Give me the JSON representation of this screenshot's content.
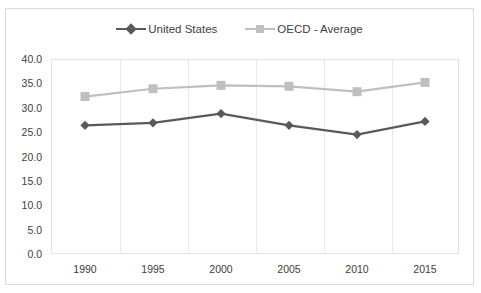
{
  "chart_data": {
    "type": "line",
    "title": "",
    "subtitle": "",
    "xlabel": "",
    "ylabel": "",
    "categories": [
      "1990",
      "1995",
      "2000",
      "2005",
      "2010",
      "2015"
    ],
    "series": [
      {
        "name": "United States",
        "values": [
          26.4,
          26.9,
          28.8,
          26.4,
          24.5,
          27.2
        ],
        "color": "#595959",
        "marker": "diamond"
      },
      {
        "name": "OECD - Average",
        "values": [
          32.3,
          33.9,
          34.6,
          34.4,
          33.3,
          35.2
        ],
        "color": "#bfbfbf",
        "marker": "square"
      }
    ],
    "ylim": [
      0.0,
      40.0
    ],
    "ytick_step": 5.0,
    "ytick_labels": [
      "40.0",
      "35.0",
      "30.0",
      "25.0",
      "20.0",
      "15.0",
      "10.0",
      "5.0",
      "0.0"
    ],
    "ytick_values": [
      40.0,
      35.0,
      30.0,
      25.0,
      20.0,
      15.0,
      10.0,
      5.0,
      0.0
    ],
    "grid": {
      "horizontal": false,
      "vertical": true
    },
    "legend": {
      "position": "top",
      "entries": [
        "United States",
        "OECD - Average"
      ]
    }
  },
  "colors": {
    "series_united_states": "#595959",
    "series_oecd_average": "#bfbfbf",
    "gridline": "#e8e8e8",
    "plot_border": "#e3e3e3",
    "frame_border": "#d9d9d9",
    "text": "#404040",
    "background": "#ffffff"
  }
}
